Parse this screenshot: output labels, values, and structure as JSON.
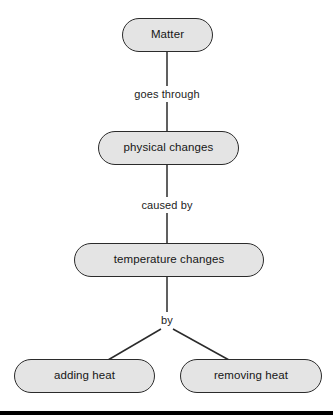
{
  "diagram": {
    "background_color": "#ffffff",
    "node_fill_color": "#e4e4e4",
    "node_border_color": "#2b2b2b",
    "connector_color": "#2b2b2b",
    "text_color": "#161616",
    "nodes": [
      {
        "id": "matter",
        "label": "Matter",
        "x": 122,
        "y": 18,
        "width": 91,
        "height": 34
      },
      {
        "id": "physical-changes",
        "label": "physical changes",
        "x": 98,
        "y": 131,
        "width": 141,
        "height": 34
      },
      {
        "id": "temperature-changes",
        "label": "temperature changes",
        "x": 74,
        "y": 243,
        "width": 190,
        "height": 34
      },
      {
        "id": "adding-heat",
        "label": "adding heat",
        "x": 14,
        "y": 359,
        "width": 141,
        "height": 34
      },
      {
        "id": "removing-heat",
        "label": "removing heat",
        "x": 180,
        "y": 359,
        "width": 142,
        "height": 34
      }
    ],
    "edge_labels": [
      {
        "id": "goes-through",
        "text": "goes through",
        "center_x": 167,
        "center_y": 94
      },
      {
        "id": "caused-by",
        "text": "caused by",
        "center_x": 167,
        "center_y": 205
      },
      {
        "id": "by",
        "text": "by",
        "center_x": 167,
        "center_y": 320
      }
    ],
    "connectors": [
      {
        "id": "matter-to-physical-upper",
        "x1": 167,
        "y1": 52,
        "x2": 167,
        "y2": 86
      },
      {
        "id": "matter-to-physical-lower",
        "x1": 167,
        "y1": 102,
        "x2": 167,
        "y2": 131
      },
      {
        "id": "physical-to-temperature-upper",
        "x1": 167,
        "y1": 165,
        "x2": 167,
        "y2": 197
      },
      {
        "id": "physical-to-temperature-lower",
        "x1": 167,
        "y1": 213,
        "x2": 167,
        "y2": 243
      },
      {
        "id": "temperature-to-by",
        "x1": 167,
        "y1": 277,
        "x2": 167,
        "y2": 312
      },
      {
        "id": "branch-left-to-adding-heat",
        "x1": 161,
        "y1": 329,
        "x2": 108,
        "y2": 360
      },
      {
        "id": "branch-right-to-removing-heat",
        "x1": 173,
        "y1": 329,
        "x2": 229,
        "y2": 360
      }
    ],
    "bottom_rule": {
      "y": 411,
      "height": 4,
      "color": "#000000"
    }
  }
}
